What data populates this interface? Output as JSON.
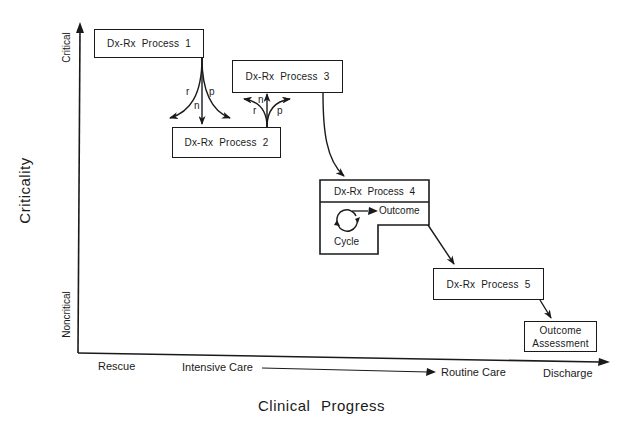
{
  "diagram": {
    "y_axis": {
      "title": "Criticality",
      "top_label": "Critical",
      "bottom_label": "Noncritical"
    },
    "x_axis": {
      "title": "Clinical Progress",
      "labels": [
        "Rescue",
        "Intensive Care",
        "Routine Care",
        "Discharge"
      ]
    },
    "processes": [
      {
        "id": "p1",
        "label": "Dx-Rx Process 1"
      },
      {
        "id": "p2",
        "label": "Dx-Rx Process 2"
      },
      {
        "id": "p3",
        "label": "Dx-Rx Process 3"
      },
      {
        "id": "p4",
        "label": "Dx-Rx Process 4",
        "cycle_label": "Cycle",
        "outcome_label": "Outcome"
      },
      {
        "id": "p5",
        "label": "Dx-Rx Process 5"
      }
    ],
    "final": {
      "line1": "Outcome",
      "line2": "Assessment"
    },
    "branch_labels": {
      "p1_down": {
        "r": "r",
        "n": "n",
        "p": "p"
      },
      "p2_up": {
        "r": "r",
        "n": "n",
        "p": "p"
      }
    },
    "edges": [
      {
        "from": "p1",
        "to": "p2",
        "type": "branch-r-n-p"
      },
      {
        "from": "p2",
        "to": "p3",
        "type": "branch-r-n-p"
      },
      {
        "from": "p3",
        "to": "p4"
      },
      {
        "from": "p4",
        "to": "p5"
      },
      {
        "from": "p5",
        "to": "final"
      }
    ]
  }
}
